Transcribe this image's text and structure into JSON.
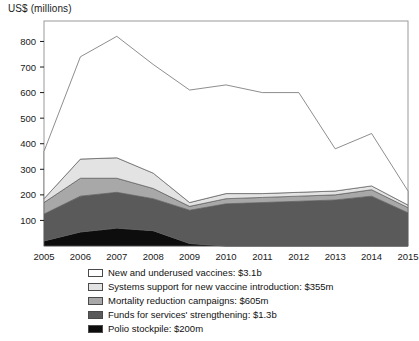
{
  "chart_data": {
    "type": "area",
    "stacked": true,
    "title": "",
    "xlabel": "",
    "ylabel": "US$ (millions)",
    "ylim": [
      0,
      880
    ],
    "xlim": [
      2005,
      2015
    ],
    "grid": false,
    "y_ticks": [
      100,
      200,
      300,
      400,
      500,
      600,
      700,
      800
    ],
    "categories": [
      "2005",
      "2006",
      "2007",
      "2008",
      "2009",
      "2010",
      "2011",
      "2012",
      "2013",
      "2014",
      "2015"
    ],
    "x": [
      2005,
      2006,
      2007,
      2008,
      2009,
      2010,
      2011,
      2012,
      2013,
      2014,
      2015
    ],
    "legend_position": "below",
    "series": [
      {
        "name": "Polio stockpile: $200m",
        "short_name": "Polio stockpile",
        "total": "$200m",
        "color": "#0d0d0d",
        "values": [
          20,
          55,
          70,
          60,
          10,
          0,
          0,
          0,
          0,
          0,
          0
        ]
      },
      {
        "name": "Funds for services' strengthening: $1.3b",
        "short_name": "Funds for services' strengthening",
        "total": "$1.3b",
        "color": "#5a5a5a",
        "values": [
          105,
          140,
          140,
          125,
          130,
          165,
          170,
          175,
          180,
          195,
          130
        ]
      },
      {
        "name": "Mortality reduction campaigns: $605m",
        "short_name": "Mortality reduction campaigns",
        "total": "$605m",
        "color": "#a8a8a8",
        "values": [
          45,
          70,
          55,
          40,
          15,
          20,
          20,
          20,
          20,
          25,
          20
        ]
      },
      {
        "name": "Systems support for new vaccine introduction: $355m",
        "short_name": "Systems support for new vaccine introduction",
        "total": "$355m",
        "color": "#e3e3e3",
        "values": [
          15,
          75,
          80,
          60,
          15,
          20,
          15,
          15,
          15,
          15,
          10
        ]
      },
      {
        "name": "New and underused vaccines: $3.1b",
        "short_name": "New and underused vaccines",
        "total": "$3.1b",
        "color": "#ffffff",
        "values": [
          185,
          400,
          475,
          425,
          440,
          425,
          395,
          390,
          165,
          205,
          55
        ]
      }
    ],
    "totals": [
      370,
      740,
      820,
      710,
      610,
      630,
      600,
      600,
      380,
      440,
      215
    ]
  }
}
